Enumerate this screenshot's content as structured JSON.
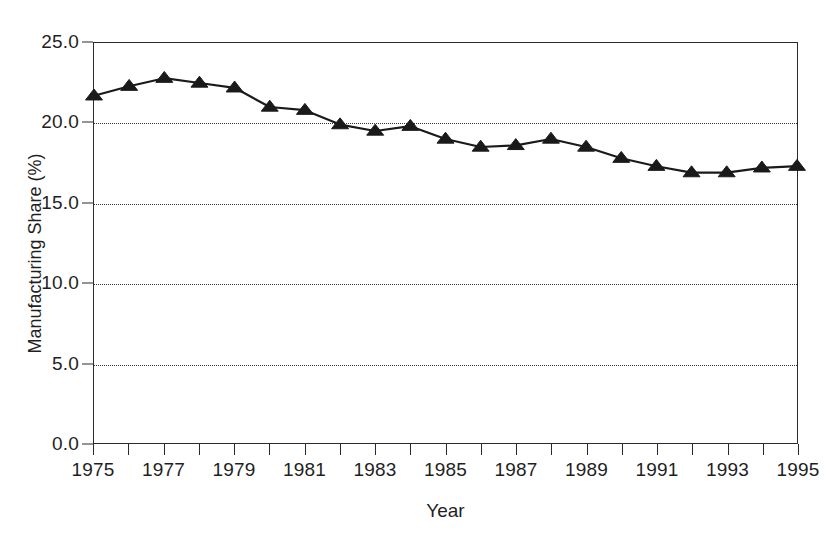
{
  "chart_data": {
    "type": "line",
    "title": "",
    "xlabel": "Year",
    "ylabel": "Manufacturing Share (%)",
    "xlim": [
      1975,
      1995
    ],
    "ylim": [
      0.0,
      25.0
    ],
    "grid": "horizontal-dotted",
    "legend": "none",
    "marker": "triangle-up",
    "line_color": "#1a1a1a",
    "marker_color": "#1a1a1a",
    "x": [
      1975,
      1976,
      1977,
      1978,
      1979,
      1980,
      1981,
      1982,
      1983,
      1984,
      1985,
      1986,
      1987,
      1988,
      1989,
      1990,
      1991,
      1992,
      1993,
      1994,
      1995
    ],
    "values": [
      21.7,
      22.3,
      22.8,
      22.5,
      22.2,
      21.0,
      20.8,
      19.9,
      19.5,
      19.8,
      19.0,
      18.5,
      18.6,
      19.0,
      18.5,
      17.8,
      17.3,
      16.9,
      16.9,
      17.2,
      17.3
    ],
    "y_ticks": [
      0.0,
      5.0,
      10.0,
      15.0,
      20.0,
      25.0
    ],
    "y_tick_labels": [
      "0.0",
      "5.0",
      "10.0",
      "15.0",
      "20.0",
      "25.0"
    ],
    "x_ticks": [
      1975,
      1976,
      1977,
      1978,
      1979,
      1980,
      1981,
      1982,
      1983,
      1984,
      1985,
      1986,
      1987,
      1988,
      1989,
      1990,
      1991,
      1992,
      1993,
      1994,
      1995
    ],
    "x_tick_labels_shown": [
      "1975",
      "1977",
      "1979",
      "1981",
      "1983",
      "1985",
      "1987",
      "1989",
      "1991",
      "1993",
      "1995"
    ],
    "x_tick_label_values": [
      1975,
      1977,
      1979,
      1981,
      1983,
      1985,
      1987,
      1989,
      1991,
      1993,
      1995
    ],
    "gridline_values": [
      5.0,
      10.0,
      15.0,
      20.0
    ]
  },
  "figure": {
    "background": "#ffffff",
    "frame_color": "#2b2b2b",
    "text_color": "#1f1f1f"
  }
}
